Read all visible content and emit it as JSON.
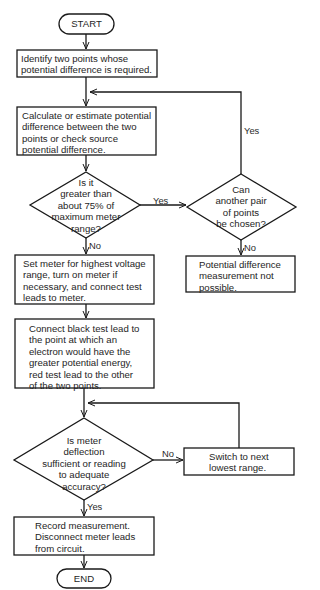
{
  "flowchart": {
    "start": "START",
    "end": "END",
    "steps": {
      "identify": "Identify two points whose\npotential difference is required.",
      "calculate": "Calculate or estimate potential\ndifference between the two\npoints or check source\npotential difference.",
      "set_meter": "Set meter for highest voltage\nrange, turn on meter if\nnecessary, and connect test\nleads to meter.",
      "connect_leads": "Connect black test lead to\nthe point at which an\nelectron would have the\ngreater potential energy,\nred test lead to the other\nof the two points.",
      "not_possible": "Potential difference\nmeasurement not\npossible.",
      "switch_range": "Switch to next\nlowest range.",
      "record": "Record measurement.\nDisconnect meter leads\nfrom circuit."
    },
    "decisions": {
      "greater_75": "Is it\ngreater than\nabout 75% of\nmaximum meter\nrange?",
      "another_pair": "Can\nanother pair\nof points\nbe chosen?",
      "deflection_ok": "Is meter\ndeflection\nsufficient or reading\nto adequate\naccuracy?"
    },
    "edge_labels": {
      "greater_yes": "Yes",
      "greater_no": "No",
      "another_yes": "Yes",
      "another_no": "No",
      "deflection_no": "No",
      "deflection_yes": "Yes"
    }
  }
}
